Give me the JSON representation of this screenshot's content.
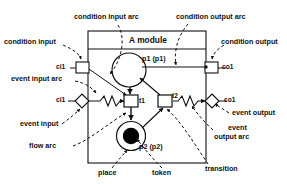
{
  "diagram": {
    "title": "A module",
    "module_box": {
      "x": 88,
      "y": 31,
      "w": 118,
      "h": 132
    },
    "inner_nodes": {
      "place_p1_label": "p1 (p1)",
      "place_p2_label": "p2 (p2)",
      "transition_t1_label": "t1",
      "transition_t2_label": "t2",
      "condition_input_port_label": "ci1",
      "condition_output_port_label": "co1",
      "event_input_port_label": "ci1",
      "event_output_port_label": "co1"
    },
    "annotations": [
      {
        "id": "condition-input-arc",
        "text": "condition input arc"
      },
      {
        "id": "condition-output-arc",
        "text": "condition output arc"
      },
      {
        "id": "condition-input",
        "text": "condition input"
      },
      {
        "id": "condition-output",
        "text": "condition output"
      },
      {
        "id": "event-input-arc",
        "text": "event input arc"
      },
      {
        "id": "event-input",
        "text": "event input"
      },
      {
        "id": "flow-arc",
        "text": "flow arc"
      },
      {
        "id": "event-output",
        "text": "event output"
      },
      {
        "id": "event-output-arc-line1",
        "text": "event"
      },
      {
        "id": "event-output-arc-line2",
        "text": "output arc"
      },
      {
        "id": "place",
        "text": "place"
      },
      {
        "id": "token",
        "text": "token"
      },
      {
        "id": "transition",
        "text": "transition"
      }
    ],
    "colors": {
      "stroke": "#111111",
      "fill": "#ffffff",
      "token": "#000000",
      "background": "#ffffff"
    }
  }
}
